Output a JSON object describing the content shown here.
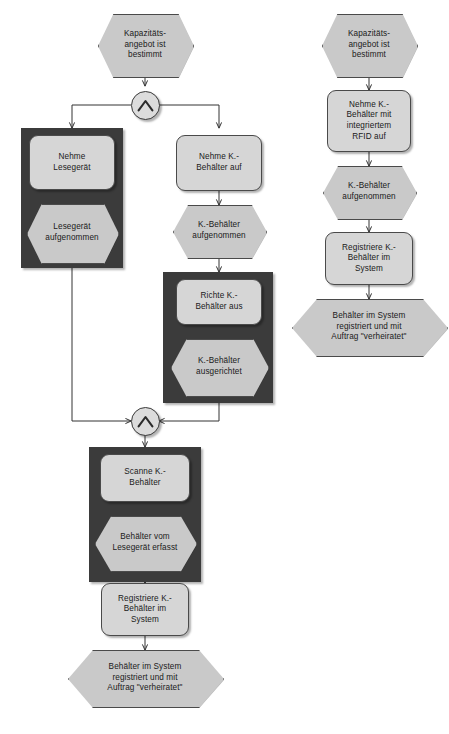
{
  "diagram": {
    "colors": {
      "function_fill": "#d6d6d6",
      "event_fill": "#c9c9c9",
      "frame_fill": "#3b3b3b",
      "connector_fill": "#dcdcdc",
      "line": "#333333",
      "background": "#ffffff"
    },
    "connector_symbol": "AND"
  },
  "left_process": {
    "start_event": {
      "label": "Kapazitäts-\nangebot ist\nbestimmt",
      "type": "event"
    },
    "split_connector": {
      "label": "AND",
      "type": "and-connector"
    },
    "branch_left": {
      "function": {
        "label": "Nehme\nLesegerät",
        "type": "function"
      },
      "event": {
        "label": "Lesegerät\naufgenommen",
        "type": "event"
      },
      "grouped": true
    },
    "branch_right": {
      "function_1": {
        "label": "Nehme K.-\nBehälter auf",
        "type": "function"
      },
      "event_1": {
        "label": "K.-Behälter\naufgenommen",
        "type": "event"
      },
      "function_2": {
        "label": "Richte K.-\nBehälter aus",
        "type": "function"
      },
      "event_2": {
        "label": "K.-Behälter\nausgerichtet",
        "type": "event"
      },
      "grouped": true
    },
    "join_connector": {
      "label": "AND",
      "type": "and-connector"
    },
    "after_join": {
      "function_1": {
        "label": "Scanne K.-\nBehälter",
        "type": "function"
      },
      "event_1": {
        "label": "Behälter vom\nLesegerät erfasst",
        "type": "event"
      },
      "function_2": {
        "label": "Registriere K.-\nBehälter im\nSystem",
        "type": "function"
      },
      "end_event": {
        "label": "Behälter im System\nregistriert und mit\nAuftrag \"verheiratet\"",
        "type": "event"
      }
    }
  },
  "right_process": {
    "start_event": {
      "label": "Kapazitäts-\nangebot ist\nbestimmt",
      "type": "event"
    },
    "function_1": {
      "label": "Nehme K.-\nBehälter mit\nintegriertem\nRFID auf",
      "type": "function"
    },
    "event_1": {
      "label": "K.-Behälter\naufgenommen",
      "type": "event"
    },
    "function_2": {
      "label": "Registriere K.-\nBehälter im\nSystem",
      "type": "function"
    },
    "end_event": {
      "label": "Behälter im System\nregistriert und mit\nAuftrag \"verheiratet\"",
      "type": "event"
    }
  }
}
